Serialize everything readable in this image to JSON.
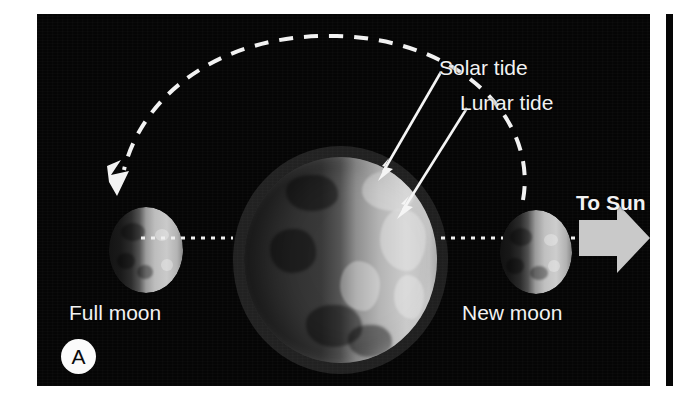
{
  "figure": {
    "panel_letter": "A",
    "background_color": "#050505",
    "page_color": "#ffffff",
    "label_color": "#f2f2f2"
  },
  "labels": {
    "solar_tide": "Solar tide",
    "lunar_tide": "Lunar tide",
    "to_sun": "To Sun",
    "full_moon": "Full moon",
    "new_moon": "New moon"
  },
  "bodies": {
    "earth": {
      "name": "Earth",
      "illuminated_side": "right"
    },
    "moon_full": {
      "name": "Full moon",
      "position": "left of Earth",
      "illuminated_side": "right"
    },
    "moon_new": {
      "name": "New moon",
      "position": "right of Earth",
      "illuminated_side": "right"
    }
  },
  "annotations": {
    "orbit_arc": "dashed lunar orbit arc from new moon over the top to full moon",
    "orbit_arrowhead": "arrowhead pointing down-left at the full moon",
    "solar_tide_pointer": "solid arrow from Solar tide label to Earth upper-right bulge",
    "lunar_tide_pointer": "solid arrow from Lunar tide label to Earth right bulge",
    "sun_direction_arrow": "thick block arrow pointing right",
    "alignment_axis": "white dotted line through full moon, Earth and new moon"
  },
  "colors": {
    "arrow_fill": "#c9c9c9",
    "dotted_axis": "#efefef",
    "dashed_orbit": "#f2f2f2",
    "badge_background": "#fbfbfb",
    "badge_text": "#0a0a0a"
  }
}
